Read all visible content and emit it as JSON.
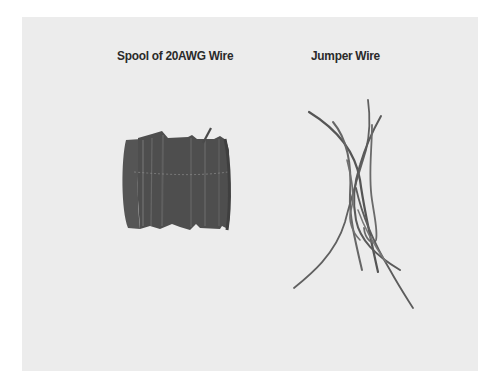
{
  "figure": {
    "items": [
      {
        "label": "Spool of 20AWG Wire",
        "illustration": "wire-spool"
      },
      {
        "label": "Jumper Wire",
        "illustration": "jumper-wires"
      }
    ]
  },
  "colors": {
    "panel": "#ececec",
    "wire_dark": "#4a4a4a",
    "wire_mid": "#6a6a6a",
    "label_text": "#2a2a2a"
  }
}
